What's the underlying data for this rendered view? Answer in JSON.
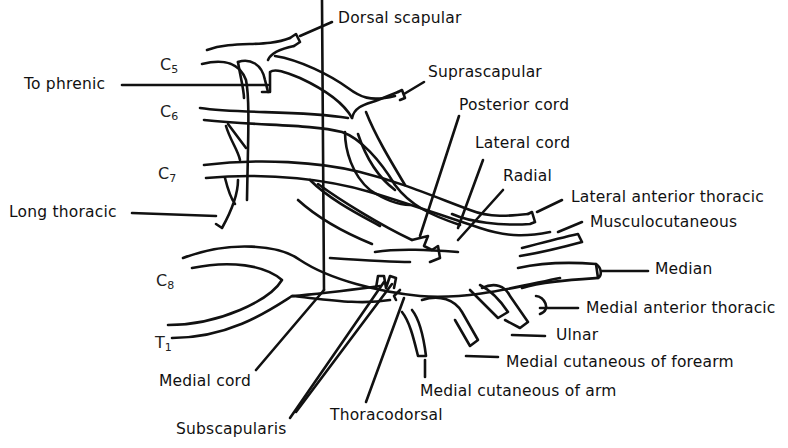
{
  "diagram": {
    "roots": [
      {
        "id": "c5",
        "letter": "C",
        "sub": "5"
      },
      {
        "id": "c6",
        "letter": "C",
        "sub": "6"
      },
      {
        "id": "c7",
        "letter": "C",
        "sub": "7"
      },
      {
        "id": "c8",
        "letter": "C",
        "sub": "8"
      },
      {
        "id": "t1",
        "letter": "T",
        "sub": "1"
      }
    ],
    "labels": {
      "dorsal_scapular": "Dorsal scapular",
      "to_phrenic": "To phrenic",
      "suprascapular": "Suprascapular",
      "posterior_cord": "Posterior cord",
      "lateral_cord": "Lateral cord",
      "radial": "Radial",
      "lateral_anterior_thoracic": "Lateral anterior thoracic",
      "long_thoracic": "Long thoracic",
      "musculocutaneous": "Musculocutaneous",
      "median": "Median",
      "medial_anterior_thoracic": "Medial anterior thoracic",
      "ulnar": "Ulnar",
      "medial_cutaneous_forearm": "Medial cutaneous of forearm",
      "medial_cord": "Medial cord",
      "medial_cutaneous_arm": "Medial cutaneous of arm",
      "thoracodorsal": "Thoracodorsal",
      "subscapularis": "Subscapularis"
    },
    "colors": {
      "ink": "#111111",
      "background": "#ffffff"
    }
  }
}
